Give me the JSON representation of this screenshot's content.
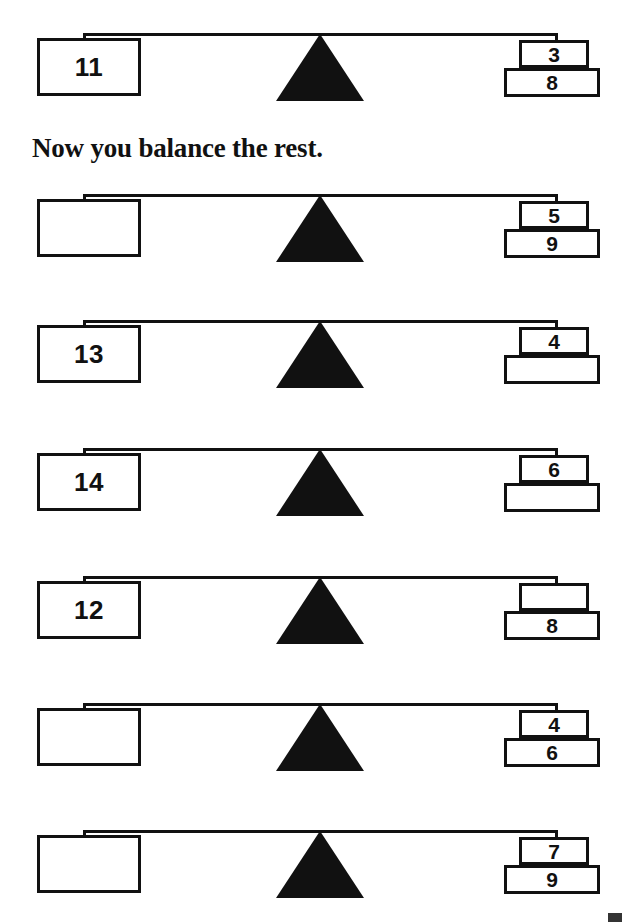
{
  "worksheet": {
    "title": "Balance the scales",
    "instruction": "Now you balance the rest.",
    "ink_color": "#111111",
    "paper_color": "#ffffff"
  },
  "example": {
    "row_label": "example-scale",
    "left_value": "11",
    "right_top_value": "3",
    "right_bottom_value": "8"
  },
  "scales": [
    {
      "row_label": "scale-row-1",
      "left_value": "",
      "right_top_value": "5",
      "right_bottom_value": "9"
    },
    {
      "row_label": "scale-row-2",
      "left_value": "13",
      "right_top_value": "4",
      "right_bottom_value": ""
    },
    {
      "row_label": "scale-row-3",
      "left_value": "14",
      "right_top_value": "6",
      "right_bottom_value": ""
    },
    {
      "row_label": "scale-row-4",
      "left_value": "12",
      "right_top_value": "",
      "right_bottom_value": "8"
    },
    {
      "row_label": "scale-row-5",
      "left_value": "",
      "right_top_value": "4",
      "right_bottom_value": "6"
    },
    {
      "row_label": "scale-row-6",
      "left_value": "",
      "right_top_value": "7",
      "right_bottom_value": "9"
    }
  ]
}
